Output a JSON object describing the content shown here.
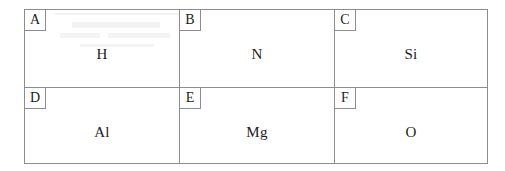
{
  "document": {
    "type": "labeled-element-grid",
    "border_color": "#8c8c92",
    "text_color": "#1b1b1b",
    "background_color": "#ffffff",
    "rows": 2,
    "columns": 3
  },
  "grid": {
    "rows": [
      {
        "cells": [
          {
            "label": "A",
            "value": "H"
          },
          {
            "label": "B",
            "value": "N"
          },
          {
            "label": "C",
            "value": "Si"
          }
        ]
      },
      {
        "cells": [
          {
            "label": "D",
            "value": "Al"
          },
          {
            "label": "E",
            "value": "Mg"
          },
          {
            "label": "F",
            "value": "O"
          }
        ]
      }
    ]
  }
}
